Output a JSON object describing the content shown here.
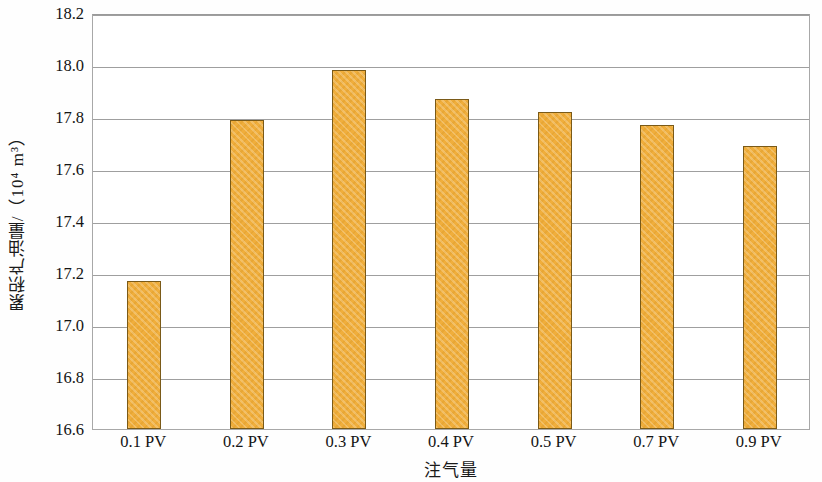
{
  "chart_data": {
    "type": "bar",
    "title": "",
    "subtitle": "",
    "xlabel": "注气量",
    "ylabel": "累积产油量/（10⁴ m³）",
    "categories": [
      "0.1 PV",
      "0.2 PV",
      "0.3 PV",
      "0.4 PV",
      "0.5 PV",
      "0.7 PV",
      "0.9 PV"
    ],
    "values": [
      17.17,
      17.79,
      17.98,
      17.87,
      17.82,
      17.77,
      17.69
    ],
    "series": [
      {
        "name": "累积产油量",
        "values": [
          17.17,
          17.79,
          17.98,
          17.87,
          17.82,
          17.77,
          17.69
        ]
      }
    ],
    "ylim": [
      16.6,
      18.2
    ],
    "ytick_step": 0.2,
    "yticks": [
      "18.2",
      "18.0",
      "17.8",
      "17.6",
      "17.4",
      "17.2",
      "17.0",
      "16.8",
      "16.6"
    ],
    "ytick_values": [
      18.2,
      18.0,
      17.8,
      17.6,
      17.4,
      17.2,
      17.0,
      16.8,
      16.6
    ],
    "grid": true,
    "grid_axis": "y",
    "legend": false,
    "legend_position": "none",
    "bar_color": "#f0ae3c",
    "bar_border_color": "#7a5a18",
    "grid_color": "#9f9f9f",
    "axis_color": "#a8a8a8",
    "text_color": "#141414",
    "plot_background": "#ffffff"
  }
}
